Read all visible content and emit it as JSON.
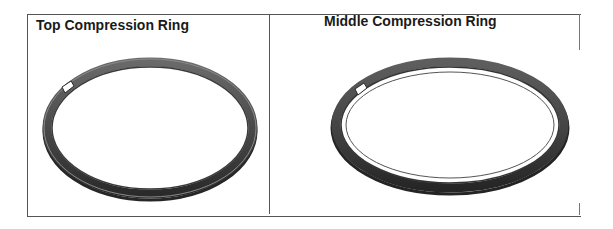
{
  "table": {
    "cells": [
      {
        "title": "Top Compression Ring",
        "image": "top-compression-ring-image"
      },
      {
        "title": "Middle Compression Ring",
        "image": "middle-compression-ring-image"
      }
    ]
  },
  "colors": {
    "ring_dark": "#2b2b2b",
    "ring_mid": "#5a5a5a",
    "ring_light": "#8a8a8a",
    "border": "#555555"
  }
}
